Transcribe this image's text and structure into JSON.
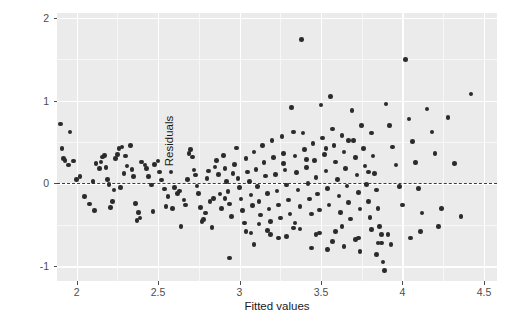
{
  "chart_data": {
    "type": "scatter",
    "title": "",
    "xlabel": "Fitted values",
    "ylabel": "Residuals",
    "xlim": [
      1.88,
      4.58
    ],
    "ylim": [
      -1.18,
      2.06
    ],
    "xticks": [
      2,
      2.5,
      3,
      3.5,
      4,
      4.5
    ],
    "xticklabels": [
      "2",
      "2.5",
      "3",
      "3.5",
      "4",
      "4.5"
    ],
    "yticks": [
      -1,
      0,
      1,
      2
    ],
    "yticklabels": [
      "-1",
      "0",
      "1",
      "2"
    ],
    "xminor": [
      2.25,
      2.75,
      3.25,
      3.75,
      4.25
    ],
    "yminor": [
      -0.5,
      0.5,
      1.5
    ],
    "grid": true,
    "legend": null,
    "panel_bg": "#ebebeb",
    "grid_major_color": "#ffffff",
    "grid_minor_color": "#f7f7f7",
    "point_color": "#2b2b2b",
    "point_size": 4.6,
    "reference_line": {
      "y": 0,
      "style": "dashed",
      "color": "#3c3c3c"
    },
    "x": [
      1.9,
      1.91,
      1.92,
      1.93,
      1.95,
      1.96,
      1.98,
      2.0,
      2.02,
      2.05,
      2.08,
      2.1,
      2.12,
      2.15,
      2.16,
      2.17,
      2.18,
      2.19,
      2.2,
      2.21,
      2.22,
      2.24,
      2.25,
      2.26,
      2.28,
      2.3,
      2.31,
      2.33,
      2.34,
      2.35,
      2.36,
      2.38,
      2.4,
      2.42,
      2.44,
      2.46,
      2.48,
      2.5,
      2.52,
      2.54,
      2.56,
      2.58,
      2.6,
      2.62,
      2.64,
      2.66,
      2.68,
      2.7,
      2.71,
      2.72,
      2.73,
      2.74,
      2.75,
      2.76,
      2.78,
      2.79,
      2.8,
      2.81,
      2.82,
      2.84,
      2.85,
      2.86,
      2.88,
      2.89,
      2.9,
      2.91,
      2.92,
      2.93,
      2.94,
      2.95,
      2.96,
      2.97,
      2.98,
      2.99,
      3.0,
      3.01,
      3.02,
      3.03,
      3.04,
      3.05,
      3.06,
      3.07,
      3.08,
      3.09,
      3.1,
      3.11,
      3.12,
      3.13,
      3.14,
      3.15,
      3.16,
      3.17,
      3.18,
      3.19,
      3.2,
      3.21,
      3.22,
      3.23,
      3.24,
      3.25,
      3.26,
      3.27,
      3.28,
      3.29,
      3.3,
      3.31,
      3.32,
      3.33,
      3.34,
      3.35,
      3.36,
      3.37,
      3.38,
      3.39,
      3.4,
      3.41,
      3.42,
      3.43,
      3.44,
      3.45,
      3.46,
      3.47,
      3.48,
      3.49,
      3.5,
      3.51,
      3.52,
      3.53,
      3.54,
      3.55,
      3.56,
      3.57,
      3.58,
      3.59,
      3.6,
      3.61,
      3.62,
      3.63,
      3.64,
      3.65,
      3.66,
      3.67,
      3.68,
      3.69,
      3.7,
      3.71,
      3.72,
      3.73,
      3.74,
      3.75,
      3.76,
      3.77,
      3.78,
      3.79,
      3.8,
      3.81,
      3.82,
      3.83,
      3.84,
      3.85,
      3.86,
      3.87,
      3.88,
      3.89,
      3.9,
      3.92,
      3.94,
      3.96,
      3.98,
      4.0,
      4.02,
      4.04,
      4.06,
      4.08,
      4.1,
      4.12,
      4.15,
      4.18,
      4.2,
      4.24,
      4.28,
      4.32,
      4.36,
      4.42,
      2.14,
      2.23,
      2.29,
      2.37,
      2.43,
      2.47,
      2.55,
      2.63,
      2.69,
      2.77,
      2.83,
      2.87,
      3.12,
      3.27,
      3.33,
      3.41,
      3.47,
      3.53,
      3.59,
      3.67,
      3.73,
      3.79,
      3.85,
      3.91,
      2.11,
      2.27,
      2.39,
      2.51,
      2.59,
      2.67,
      2.91,
      3.07,
      3.17,
      3.29,
      3.37,
      3.49,
      3.57,
      3.63,
      3.71,
      3.81,
      3.87,
      3.93,
      4.05,
      4.11,
      4.22,
      3.34,
      3.44,
      3.54,
      3.64,
      3.74,
      3.84,
      2.94,
      3.04,
      3.24,
      3.09,
      3.19
    ],
    "y": [
      0.72,
      0.42,
      0.3,
      0.28,
      0.22,
      0.62,
      0.27,
      0.05,
      0.08,
      -0.16,
      -0.25,
      0.02,
      0.24,
      0.26,
      0.32,
      0.34,
      0.19,
      0.05,
      -0.01,
      -0.29,
      -0.22,
      0.3,
      0.35,
      0.42,
      0.44,
      0.33,
      0.21,
      0.46,
      0.17,
      0.08,
      -0.24,
      -0.35,
      0.26,
      0.22,
      0.08,
      -0.02,
      0.23,
      0.27,
      0.04,
      -0.07,
      -0.16,
      0.14,
      -0.05,
      -0.12,
      -0.52,
      -0.2,
      0.05,
      0.41,
      0.32,
      0.16,
      0.1,
      -0.03,
      -0.12,
      -0.29,
      -0.44,
      -0.36,
      0.06,
      0.15,
      -0.22,
      -0.18,
      0.2,
      0.28,
      -0.13,
      -0.3,
      0.34,
      0.18,
      0.02,
      -0.1,
      -0.25,
      -0.4,
      0.12,
      0.23,
      0.43,
      0.06,
      -0.05,
      -0.19,
      -0.33,
      -0.48,
      0.3,
      0.14,
      0.02,
      -0.14,
      -0.27,
      0.38,
      0.17,
      -0.04,
      -0.22,
      -0.38,
      0.46,
      0.25,
      0.09,
      -0.12,
      -0.31,
      -0.46,
      0.52,
      0.31,
      0.11,
      -0.09,
      -0.26,
      -0.42,
      0.57,
      0.36,
      0.16,
      -0.02,
      -0.2,
      -0.37,
      0.92,
      0.62,
      0.33,
      0.13,
      -0.08,
      -0.28,
      1.74,
      0.61,
      0.41,
      0.19,
      0.0,
      -0.19,
      -0.37,
      0.48,
      0.28,
      0.07,
      -0.13,
      -0.32,
      0.95,
      0.55,
      0.35,
      0.15,
      -0.06,
      -0.26,
      1.05,
      0.66,
      0.46,
      0.26,
      0.05,
      -0.15,
      -0.35,
      0.58,
      0.38,
      0.18,
      -0.03,
      -0.23,
      -0.43,
      0.88,
      0.52,
      0.31,
      0.1,
      -0.11,
      -0.31,
      0.7,
      0.42,
      0.21,
      -0.01,
      -0.22,
      -0.41,
      0.61,
      0.33,
      0.12,
      -0.08,
      -0.3,
      -0.52,
      -0.72,
      -0.95,
      -1.05,
      0.96,
      0.7,
      0.44,
      0.22,
      -0.04,
      -0.26,
      1.5,
      0.78,
      0.51,
      0.25,
      -0.06,
      -0.36,
      0.9,
      0.62,
      0.36,
      -0.3,
      0.8,
      0.24,
      -0.4,
      1.08,
      0.18,
      -0.08,
      0.12,
      -0.45,
      0.18,
      -0.34,
      -0.28,
      -0.09,
      0.36,
      -0.46,
      -0.53,
      0.11,
      -0.49,
      0.24,
      -0.54,
      0.29,
      -0.62,
      0.42,
      -0.58,
      0.52,
      -0.66,
      0.14,
      -0.72,
      -0.62,
      -0.33,
      -0.05,
      -0.42,
      0.14,
      -0.3,
      -0.26,
      -0.18,
      -0.6,
      -0.57,
      -0.64,
      -0.55,
      -0.6,
      -0.7,
      -0.52,
      -0.68,
      -0.56,
      -0.62,
      -0.74,
      -0.66,
      -0.58,
      -0.52,
      -0.48,
      -0.78,
      -0.8,
      -0.76,
      -0.82,
      -0.86,
      -0.9,
      -0.58,
      -0.66,
      -0.74,
      -0.62,
      -0.7
    ]
  }
}
